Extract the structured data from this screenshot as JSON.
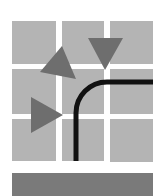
{
  "icon": {
    "name": "route-grid-icon",
    "colors": {
      "background": "#ffffff",
      "cell": "#b4b4b4",
      "arrow": "#6e6e6e",
      "path": "#111111",
      "bar": "#7a7a7a"
    },
    "grid": {
      "columns": [
        [
          12,
          56
        ],
        [
          62,
          104
        ],
        [
          110,
          153
        ]
      ],
      "rows": [
        [
          21,
          64
        ],
        [
          69,
          114
        ],
        [
          119,
          161
        ]
      ]
    },
    "arrows": [
      {
        "name": "arrow-up-left",
        "points": "62,46 40,72 76,79"
      },
      {
        "name": "arrow-down",
        "points": "88,38 123,38 105,70"
      },
      {
        "name": "arrow-right",
        "points": "31,97 31,133 63,115"
      }
    ]
  }
}
